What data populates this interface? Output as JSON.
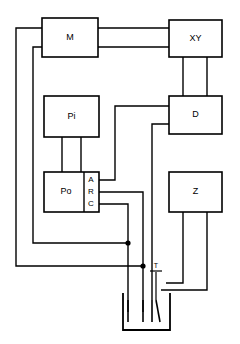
{
  "figure": {
    "kind": "schematic-block-diagram",
    "width": 240,
    "height": 344,
    "background_color": "#ffffff",
    "line_color": "#000000"
  },
  "blocks": [
    {
      "id": "m",
      "label": "M",
      "x": 42,
      "y": 18,
      "w": 56,
      "h": 39
    },
    {
      "id": "xy",
      "label": "XY",
      "x": 169,
      "y": 20,
      "w": 53,
      "h": 37
    },
    {
      "id": "pi",
      "label": "Pi",
      "x": 44,
      "y": 96,
      "w": 55,
      "h": 41
    },
    {
      "id": "d",
      "label": "D",
      "x": 169,
      "y": 96,
      "w": 53,
      "h": 38
    },
    {
      "id": "po",
      "label": "Po",
      "x": 44,
      "y": 172,
      "w": 55,
      "h": 40
    },
    {
      "id": "z",
      "label": "Z",
      "x": 169,
      "y": 172,
      "w": 53,
      "h": 40
    }
  ],
  "terminals": [
    {
      "id": "terminal-a",
      "label": "A",
      "x": 91,
      "y": 180
    },
    {
      "id": "terminal-r",
      "label": "R",
      "x": 91,
      "y": 192
    },
    {
      "id": "terminal-c",
      "label": "C",
      "x": 91,
      "y": 204
    }
  ],
  "probe": {
    "id": "temperature-probe",
    "label": "T",
    "x": 156,
    "y": 272
  },
  "junctions": [
    {
      "id": "junction-upper",
      "x": 128,
      "y": 243
    },
    {
      "id": "junction-lower",
      "x": 143,
      "y": 266
    }
  ],
  "vessel": {
    "id": "electrochemical-cell",
    "x": 123,
    "y": 293,
    "w": 47,
    "h": 37
  },
  "wires": [
    {
      "id": "wire-m-to-xy-upper",
      "path": "M 98 28 L 169 28"
    },
    {
      "id": "wire-m-to-xy-lower",
      "path": "M 98 47 L 169 47"
    },
    {
      "id": "wire-xy-to-d-left",
      "path": "M 183 57 L 183 96"
    },
    {
      "id": "wire-xy-to-d-right",
      "path": "M 207 57 L 207 96"
    },
    {
      "id": "wire-pi-to-po-left",
      "path": "M 62 137 L 62 172"
    },
    {
      "id": "wire-pi-to-po-right",
      "path": "M 81 137 L 81 172"
    },
    {
      "id": "wire-a-to-d",
      "path": "M 99 180 L 115 180 L 115 106 L 169 106"
    },
    {
      "id": "wire-d-to-cell",
      "path": "M 169 124 L 152 124 L 152 300"
    },
    {
      "id": "wire-r-to-lower-node",
      "path": "M 99 192 L 143 192 L 143 312"
    },
    {
      "id": "wire-c-to-upper-node",
      "path": "M 99 204 L 128 204 L 128 312"
    },
    {
      "id": "wire-m-left-outer",
      "path": "M 42 28 L 16 28 L 16 266 L 143 266"
    },
    {
      "id": "wire-m-left-inner",
      "path": "M 42 47 L 33 47 L 33 243 L 128 243"
    },
    {
      "id": "wire-z-left-down",
      "path": "M 183 212 L 183 283 L 166 283"
    },
    {
      "id": "wire-z-right-down",
      "path": "M 207 212 L 207 290 L 161 290"
    },
    {
      "id": "wire-probe-stem",
      "path": "M 156 276 L 156 300"
    },
    {
      "id": "wire-probe-cross",
      "path": "M 150 272 L 162 272"
    }
  ]
}
